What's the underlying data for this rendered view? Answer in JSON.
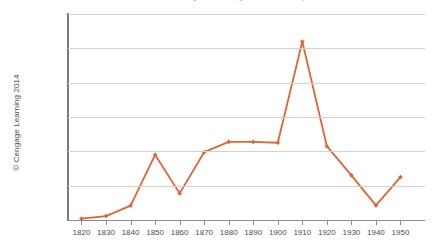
{
  "chart_data": {
    "type": "line",
    "title": "Number of Immigrants Entering the United States, 1820-1950",
    "xlabel": "",
    "ylabel": "",
    "categories": [
      "1820",
      "1830",
      "1840",
      "1850",
      "1860",
      "1870",
      "1880",
      "1890",
      "1900",
      "1910",
      "1920",
      "1930",
      "1940",
      "1950"
    ],
    "values": [
      8000,
      23000,
      84000,
      380000,
      155000,
      395000,
      455000,
      455000,
      450000,
      1040000,
      430000,
      260000,
      85000,
      250000
    ],
    "series": [
      {
        "name": "Immigrants",
        "color": "#DD6633",
        "values": [
          8000,
          23000,
          84000,
          380000,
          155000,
          395000,
          455000,
          455000,
          450000,
          1040000,
          430000,
          260000,
          85000,
          250000
        ]
      }
    ],
    "ylim": [
      0,
      1200000
    ],
    "ytick_values": [
      0,
      200000,
      400000,
      600000,
      800000,
      1000000,
      1200000
    ],
    "ytick_labels": [
      "0",
      "200,000",
      "400,000",
      "600,000",
      "800,000",
      "1,000,000",
      "1,200,000"
    ],
    "xlim": [
      1820,
      1950
    ],
    "grid": true,
    "grid_axis": "y",
    "legend": false,
    "marker": "diamond"
  },
  "credit": {
    "text": "© Cengage Learning 2014"
  },
  "colors": {
    "series": "#DD6633",
    "gridline": "#d2d2d2",
    "axis": "#8d8d8d",
    "text": "#4d4d4d",
    "background": "#ffffff"
  },
  "artifact": {
    "bottom_text": ""
  }
}
